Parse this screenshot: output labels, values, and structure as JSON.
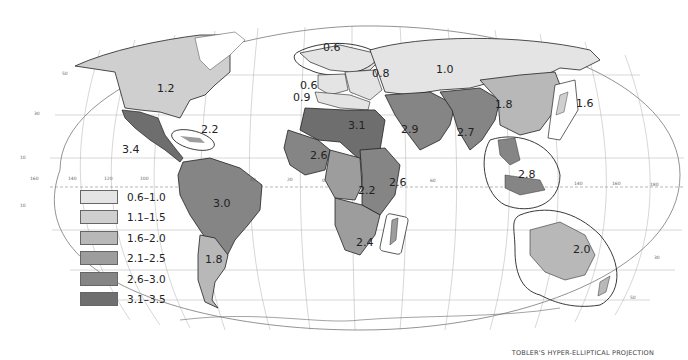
{
  "map": {
    "projection_caption": "TOBLER'S HYPER-ELLIPTICAL PROJECTION",
    "legend": [
      {
        "label": "0.6–1.0",
        "color": "#e4e4e4"
      },
      {
        "label": "1.1–1.5",
        "color": "#cfcfcf"
      },
      {
        "label": "1.6–2.0",
        "color": "#b8b8b8"
      },
      {
        "label": "2.1–2.5",
        "color": "#9d9d9d"
      },
      {
        "label": "2.6–3.0",
        "color": "#858585"
      },
      {
        "label": "3.1–3.5",
        "color": "#6e6e6e"
      }
    ],
    "regions": [
      {
        "name": "North America",
        "value": "1.2"
      },
      {
        "name": "Caribbean",
        "value": "2.2"
      },
      {
        "name": "Central America & Mexico",
        "value": "3.4"
      },
      {
        "name": "Tropical South America",
        "value": "3.0"
      },
      {
        "name": "Temperate South America",
        "value": "1.8"
      },
      {
        "name": "Northern Europe",
        "value": "0.6"
      },
      {
        "name": "Western Europe",
        "value": "0.6"
      },
      {
        "name": "Southern Europe",
        "value": "0.9"
      },
      {
        "name": "Eastern Europe",
        "value": "0.8"
      },
      {
        "name": "USSR",
        "value": "1.0"
      },
      {
        "name": "North Africa",
        "value": "3.1"
      },
      {
        "name": "West Africa",
        "value": "2.6"
      },
      {
        "name": "Middle Africa",
        "value": "2.2"
      },
      {
        "name": "East Africa",
        "value": "2.6"
      },
      {
        "name": "Southern Africa",
        "value": "2.4"
      },
      {
        "name": "Southwest Asia",
        "value": "2.9"
      },
      {
        "name": "Middle South Asia",
        "value": "2.7"
      },
      {
        "name": "East Asia (mainland)",
        "value": "1.8"
      },
      {
        "name": "Japan",
        "value": "1.6"
      },
      {
        "name": "Southeast Asia",
        "value": "2.8"
      },
      {
        "name": "Oceania",
        "value": "2.0"
      }
    ],
    "graticule_labels": {
      "longitudes_equator": [
        "160",
        "140",
        "120",
        "100",
        "40",
        "20",
        "0",
        "60",
        "140",
        "160",
        "180"
      ],
      "latitudes": [
        "50",
        "30",
        "10",
        "10",
        "30",
        "50"
      ]
    }
  }
}
